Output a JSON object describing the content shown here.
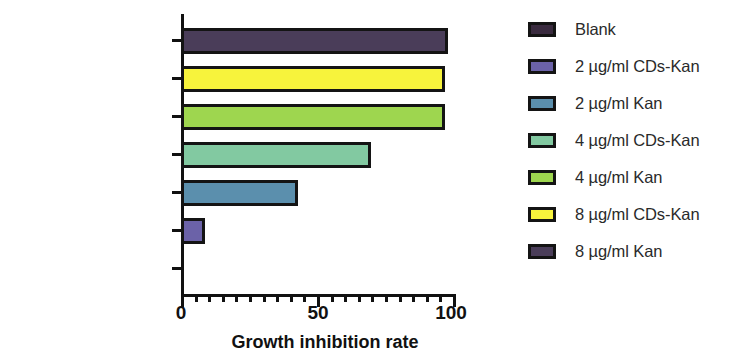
{
  "chart_data": {
    "type": "bar",
    "orientation": "horizontal",
    "title": "",
    "xlabel": "Growth inhibition rate",
    "ylabel": "",
    "xlim": [
      0,
      100
    ],
    "x_major_ticks": [
      0,
      50,
      100
    ],
    "x_tick_labels": [
      "0",
      "50",
      "100"
    ],
    "x_minor_tick_interval": 5,
    "grid": false,
    "categories": [
      "8 µg/ml Kan",
      "8 µg/ml CDs-Kan",
      "4 µg/ml Kan",
      "4 µg/ml CDs-Kan",
      "2 µg/ml Kan",
      "2 µg/ml CDs-Kan",
      "Blank"
    ],
    "values": [
      98,
      97,
      97,
      70,
      43,
      9,
      0
    ],
    "bar_colors": [
      "#4a3d59",
      "#f7f33c",
      "#9ed64f",
      "#82c9a1",
      "#5b8fad",
      "#6b62a8",
      "#ffffff"
    ],
    "bar_edge_color": "#141414",
    "legend": {
      "position": "right",
      "entries": [
        {
          "label": "Blank",
          "color": "#3a2b3f"
        },
        {
          "label": "2 µg/ml CDs-Kan",
          "color": "#6b62a8"
        },
        {
          "label": "2 µg/ml Kan",
          "color": "#5b8fad"
        },
        {
          "label": "4 µg/ml CDs-Kan",
          "color": "#82c9a1"
        },
        {
          "label": "4 µg/ml Kan",
          "color": "#9ed64f"
        },
        {
          "label": "8 µg/ml CDs-Kan",
          "color": "#f7f33c"
        },
        {
          "label": "8 µg/ml Kan",
          "color": "#4a3d59"
        }
      ]
    }
  },
  "axis": {
    "x_title": "Growth inhibition rate",
    "tick_0": "0",
    "tick_50": "50",
    "tick_100": "100"
  },
  "category_labels": {
    "row0": "8 µg/ml Kan",
    "row1": "8 µg/ml CDs-Kan",
    "row2": "4 µg/ml Kan",
    "row3": "4 µg/ml CDs-Kan",
    "row4": "2 µg/ml Kan",
    "row5": "2 µg/ml CDs-Kan",
    "row6": "Blank"
  },
  "legend_labels": {
    "item0": "Blank",
    "item1": "2 µg/ml CDs-Kan",
    "item2": "2 µg/ml Kan",
    "item3": "4 µg/ml CDs-Kan",
    "item4": "4 µg/ml Kan",
    "item5": "8 µg/ml CDs-Kan",
    "item6": "8 µg/ml Kan"
  }
}
